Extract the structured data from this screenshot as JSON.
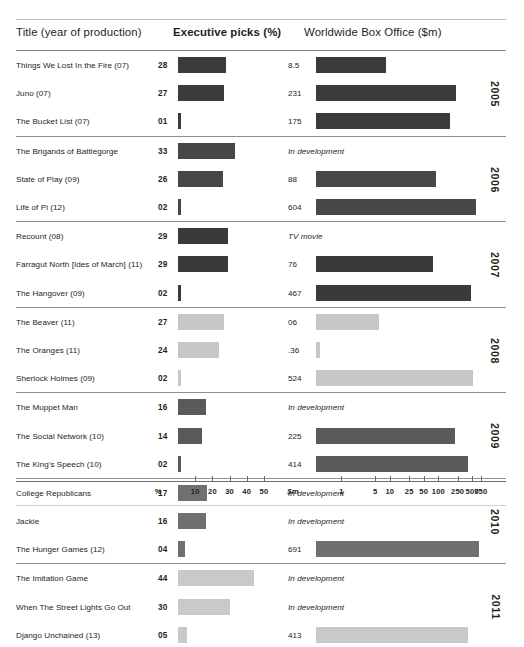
{
  "header": {
    "col_title": "Title (year of production)",
    "col_picks": "Executive picks (%)",
    "col_box": "Worldwide Box Office ($m)"
  },
  "axis": {
    "picks_unit": "%",
    "picks_ticks": [
      "10",
      "20",
      "30",
      "40",
      "50"
    ],
    "box_unit": "$m",
    "box_ticks": [
      "1",
      "5",
      "10",
      "25",
      "50",
      "100",
      "250",
      "500",
      "750"
    ]
  },
  "chart_data": {
    "type": "bar",
    "xlabel": "",
    "ylabel": "",
    "series": [
      {
        "name": "Executive picks (%)",
        "axis": "linear",
        "xlim": [
          0,
          55
        ]
      },
      {
        "name": "Worldwide Box Office ($m)",
        "axis": "log",
        "xlim": [
          0.3,
          900
        ]
      }
    ],
    "groups": [
      {
        "year": "2005",
        "shade": "#3b3b3b",
        "rows": [
          {
            "title": "Things We Lost In the Fire (07)",
            "picks": 28,
            "picks_label": "28",
            "box": 8.5,
            "box_label": "8.5",
            "box_status": ""
          },
          {
            "title": "Juno (07)",
            "picks": 27,
            "picks_label": "27",
            "box": 231,
            "box_label": "231",
            "box_status": ""
          },
          {
            "title": "The Bucket List (07)",
            "picks": 1,
            "picks_label": "01",
            "box": 175,
            "box_label": "175",
            "box_status": ""
          }
        ]
      },
      {
        "year": "2006",
        "shade": "#474747",
        "rows": [
          {
            "title": "The Brigands of Battlegorge",
            "picks": 33,
            "picks_label": "33",
            "box": null,
            "box_label": "In development",
            "box_status": "dev"
          },
          {
            "title": "State of Play (09)",
            "picks": 26,
            "picks_label": "26",
            "box": 88,
            "box_label": "88",
            "box_status": ""
          },
          {
            "title": "Life of Pi (12)",
            "picks": 2,
            "picks_label": "02",
            "box": 604,
            "box_label": "604",
            "box_status": ""
          }
        ]
      },
      {
        "year": "2007",
        "shade": "#3a3a3a",
        "rows": [
          {
            "title": "Recount (08)",
            "picks": 29,
            "picks_label": "29",
            "box": null,
            "box_label": "TV movie",
            "box_status": "dev"
          },
          {
            "title": "Farragut North [Ides of March] (11)",
            "picks": 29,
            "picks_label": "29",
            "box": 76,
            "box_label": "76",
            "box_status": ""
          },
          {
            "title": "The Hangover (09)",
            "picks": 2,
            "picks_label": "02",
            "box": 467,
            "box_label": "467",
            "box_status": ""
          }
        ]
      },
      {
        "year": "2008",
        "shade": "#c6c6c6",
        "rows": [
          {
            "title": "The Beaver (11)",
            "picks": 27,
            "picks_label": "27",
            "box": 6,
            "box_label": "06",
            "box_status": ""
          },
          {
            "title": "The Oranges (11)",
            "picks": 24,
            "picks_label": "24",
            "box": 0.36,
            "box_label": ".36",
            "box_status": ""
          },
          {
            "title": "Sherlock Holmes (09)",
            "picks": 2,
            "picks_label": "02",
            "box": 524,
            "box_label": "524",
            "box_status": ""
          }
        ]
      },
      {
        "year": "2009",
        "shade": "#5a5a5a",
        "rows": [
          {
            "title": "The Muppet Man",
            "picks": 16,
            "picks_label": "16",
            "box": null,
            "box_label": "In development",
            "box_status": "dev"
          },
          {
            "title": "The Social Network (10)",
            "picks": 14,
            "picks_label": "14",
            "box": 225,
            "box_label": "225",
            "box_status": ""
          },
          {
            "title": "The King's Speech (10)",
            "picks": 2,
            "picks_label": "02",
            "box": 414,
            "box_label": "414",
            "box_status": ""
          }
        ]
      },
      {
        "year": "2010",
        "shade": "#707070",
        "rows": [
          {
            "title": "College Republicans",
            "picks": 17,
            "picks_label": "17",
            "box": null,
            "box_label": "In development",
            "box_status": "dev"
          },
          {
            "title": "Jackie",
            "picks": 16,
            "picks_label": "16",
            "box": null,
            "box_label": "In development",
            "box_status": "dev"
          },
          {
            "title": "The Hunger Games (12)",
            "picks": 4,
            "picks_label": "04",
            "box": 691,
            "box_label": "691",
            "box_status": ""
          }
        ]
      },
      {
        "year": "2011",
        "shade": "#c9c9c9",
        "rows": [
          {
            "title": "The Imitation Game",
            "picks": 44,
            "picks_label": "44",
            "box": null,
            "box_label": "In development",
            "box_status": "dev"
          },
          {
            "title": "When The Street Lights Go Out",
            "picks": 30,
            "picks_label": "30",
            "box": null,
            "box_label": "In development",
            "box_status": "dev"
          },
          {
            "title": "Django Unchained (13)",
            "picks": 5,
            "picks_label": "05",
            "box": 413,
            "box_label": "413",
            "box_status": ""
          }
        ]
      }
    ]
  }
}
